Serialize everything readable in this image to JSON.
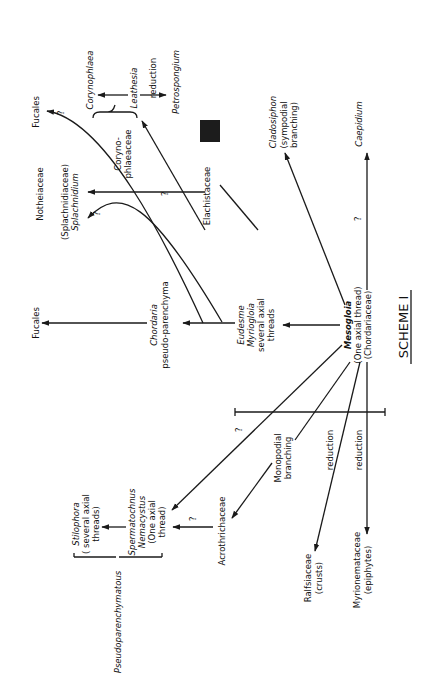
{
  "title": "SCHEME I",
  "orientation": "rotated 90° counter-clockwise (text reads bottom-to-top)",
  "nodes": {
    "fucales_top": "Fucales",
    "notheiaceae": "Notheiaceae",
    "splachnidiaceae": "(Splachnidiaceae)",
    "splachnidium": "Splachnidium",
    "coryno_a": "Coryno-",
    "coryno_b": "phlaeaceae",
    "corynophlaea": "Corynophlaea",
    "leathesia": "Leathesia",
    "reduction_top": "reduction",
    "petrospongium": "Petrospongium",
    "elachistaceae": "Elachistaceae",
    "cladosiphon": "Cladosiphon",
    "cladosiphon_note_a": "(sympodial",
    "cladosiphon_note_b": "branching)",
    "caepidium": "Caepidium",
    "fucales_left": "Fucales",
    "chordaria": "Chordaria",
    "chordaria_note": "pseudo-parenchyma",
    "eudesme": "Eudesme",
    "myriogloia": "Myriogloia",
    "eudesme_note_a": "several axial",
    "eudesme_note_b": "threads",
    "mesogloia": "Mesogloia",
    "mesogloia_note_a": "(One axial thread)",
    "mesogloia_note_b": "(Chordariaceae)",
    "stilophora": "Stilophora",
    "stilophora_note_a": "( several axial",
    "stilophora_note_b": "threads)",
    "spermatochnus": "Spermatochnus",
    "nemacystus": "Nemacystus",
    "nemacystus_note_a": "(One axial",
    "nemacystus_note_b": "thread)",
    "pseudoparenchymatous": "Pseudoparenchymatous",
    "acrothrichaceae": "Acrothrichaceae",
    "monopodial_a": "Monopodial",
    "monopodial_b": "branching",
    "reduction_mid": "reduction",
    "reduction_low": "reduction",
    "ralfsiaceae": "Ralfsiaceae",
    "ralfsiaceae_note": "(crusts)",
    "myrionemataceae": "Myrionemataceae",
    "myrionemataceae_note": "(epiphytes)"
  },
  "uncertainty_mark": "?",
  "colors": {
    "ink": "#1a1a1a",
    "paper": "#ffffff",
    "marker_box": "#1c1c1c"
  }
}
